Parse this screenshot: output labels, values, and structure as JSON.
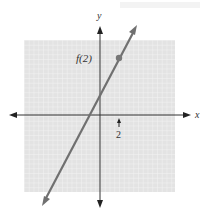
{
  "figure": {
    "axis_x_label": "x",
    "axis_y_label": "y",
    "point_label": "f(2)",
    "tick_label": "2",
    "function": "f(x) = 2x + 2",
    "point": {
      "x": 2,
      "y": 6
    },
    "grid_range": {
      "x": [
        -8,
        8
      ],
      "y": [
        -8,
        8
      ]
    },
    "colors": {
      "grid_bg": "#e4e4e4",
      "grid_line": "#f7f7f7",
      "line": "#707070",
      "axis": "#333333"
    }
  }
}
